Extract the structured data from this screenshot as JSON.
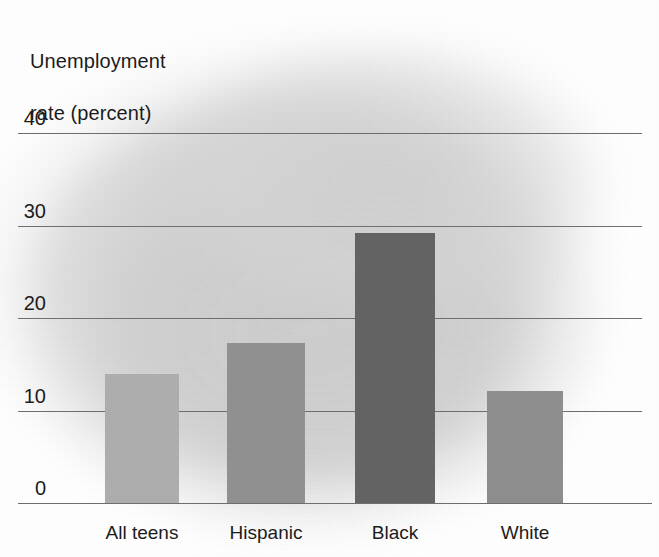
{
  "chart_data": {
    "type": "bar",
    "title": "Unemployment\nrate (percent)",
    "title_line1": "Unemployment",
    "title_line2": "rate (percent)",
    "xlabel": "",
    "ylabel": "Unemployment rate (percent)",
    "categories": [
      "All teens",
      "Hispanic",
      "Black",
      "White"
    ],
    "values": [
      14.0,
      17.3,
      29.2,
      12.1
    ],
    "ylim": [
      0,
      43
    ],
    "yticks": [
      0,
      10,
      20,
      30,
      40
    ],
    "ytick_labels": [
      "0",
      "10",
      "20",
      "30",
      "40"
    ],
    "grid": true,
    "legend": "none",
    "bar_colors": [
      "#aeaeae",
      "#919191",
      "#636363",
      "#8e8e8e"
    ],
    "axis_color": "#6e6e6e",
    "text_color": "#1c1c1c",
    "background_color": "#ffffff"
  }
}
